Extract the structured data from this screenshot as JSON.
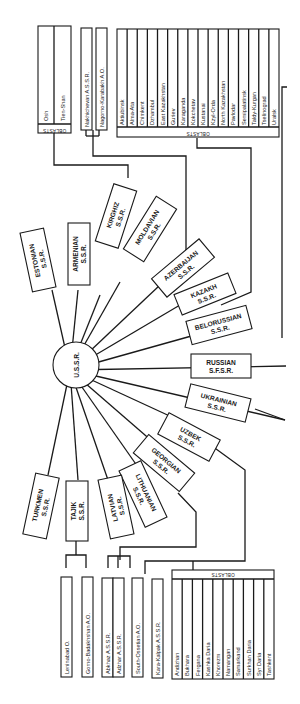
{
  "diagram": {
    "center": {
      "label": "U.S.S.R."
    },
    "republics": [
      {
        "id": "estonian",
        "name": "ESTONIAN",
        "suffix": "S.S.R."
      },
      {
        "id": "armenian",
        "name": "ARMENIAN",
        "suffix": "S.S.R."
      },
      {
        "id": "kirghiz",
        "name": "KIRGHIZ",
        "suffix": "S.S.R."
      },
      {
        "id": "moldavian",
        "name": "MOLDAVIAN",
        "suffix": "S.S.R."
      },
      {
        "id": "azerbaijan",
        "name": "AZERBAIJAN",
        "suffix": "S.S.R."
      },
      {
        "id": "kazakh",
        "name": "KAZAKH",
        "suffix": "S.S.R."
      },
      {
        "id": "belorussian",
        "name": "BELORUSSIAN",
        "suffix": "S.S.R."
      },
      {
        "id": "russian",
        "name": "RUSSIAN",
        "suffix": "S.F.S.R."
      },
      {
        "id": "ukrainian",
        "name": "UKRAINIAN",
        "suffix": "S.S.R."
      },
      {
        "id": "uzbek",
        "name": "UZBEK",
        "suffix": "S.S.R."
      },
      {
        "id": "georgian",
        "name": "GEORGIAN",
        "suffix": "S.S.R."
      },
      {
        "id": "lithuanian",
        "name": "LITHUANIAN",
        "suffix": "S.S.R."
      },
      {
        "id": "latvian",
        "name": "LATVIAN",
        "suffix": "S.S.R."
      },
      {
        "id": "tajik",
        "name": "TAJIK",
        "suffix": "S.S.R."
      },
      {
        "id": "turkmen",
        "name": "TURKMEN",
        "suffix": "S.S.R."
      }
    ],
    "kirghiz_subdivisions": {
      "header": "OBLASTS",
      "items": [
        "Osh",
        "Tien-Shan"
      ]
    },
    "azerbaijan_subdivisions": [
      "Nakhichevan A.S.S.R.",
      "Nagorno-Karabakh A.O."
    ],
    "kazakh_subdivisions": {
      "header": "OBLASTS",
      "items": [
        "Aktiubinsk",
        "Alma-Ata",
        "Chimkent",
        "Dzhambul",
        "East Kazakhstan",
        "Guriev",
        "Karaganda",
        "Kokchetav",
        "Kustanai",
        "Kzyl-Orda",
        "North Kazakhstan",
        "Pavlodar",
        "Semipalatinsk",
        "Taldy-Kurgan",
        "Tselinograd",
        "Uralsk"
      ]
    },
    "tajik_subdivisions": [
      "Leninabad O.",
      "Gorno-Badakhshan A.O."
    ],
    "georgian_subdivisions": [
      "Abkhaz A.S.S.R.",
      "Adzhar A.S.S.R.",
      "South-Ossetian A.O."
    ],
    "uzbek_subdivisions": {
      "autonomous": "Kara-Kalpak A.S.S.R.",
      "header": "OBLASTS",
      "items": [
        "Andizhan",
        "Bukhara",
        "Fergana",
        "Kashka Daria",
        "Khorezm",
        "Namangan",
        "Samarkand",
        "Surkhan Daria",
        "Syr Daria",
        "Tashkent"
      ]
    }
  }
}
